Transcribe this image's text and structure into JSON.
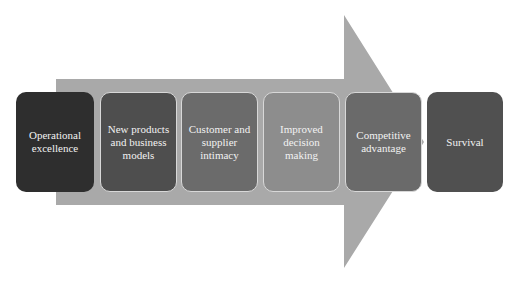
{
  "diagram": {
    "type": "process-arrow",
    "arrow_color": "#a9a9a9",
    "steps": [
      {
        "label": "Operational excellence",
        "fill": "#2e2e2e"
      },
      {
        "label": "New products and business models",
        "fill": "#4e4e4e"
      },
      {
        "label": "Customer and supplier intimacy",
        "fill": "#6b6b6b"
      },
      {
        "label": "Improved decision making",
        "fill": "#8d8d8d"
      },
      {
        "label": "Competitive advantage",
        "fill": "#6a6a6a"
      },
      {
        "label": "Survival",
        "fill": "#505050"
      }
    ]
  }
}
